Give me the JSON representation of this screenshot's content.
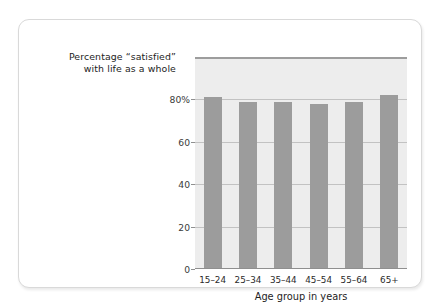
{
  "figure": {
    "background_color": "#ffffff",
    "border_color": "#d9d9d9",
    "plot_background_color": "#ededed",
    "bar_color": "#9c9c9c",
    "gridline_color": "#c2c2c2",
    "axis_color": "#8f8f8f"
  },
  "title_lines": [
    "Percentage “satisfied”",
    "with life as a whole"
  ],
  "chart_data": {
    "type": "bar",
    "title": "Percentage “satisfied” with life as a whole",
    "xlabel": "Age group in years",
    "ylabel": "",
    "categories": [
      "15–24",
      "25–34",
      "35–44",
      "45–54",
      "55–64",
      "65+"
    ],
    "values": [
      81,
      79,
      79,
      78,
      79,
      82
    ],
    "ylim": [
      0,
      100
    ],
    "yticks": [
      0,
      20,
      40,
      60,
      80
    ],
    "ytick_labels": [
      "0",
      "20",
      "40",
      "60",
      "80%"
    ],
    "grid": true,
    "legend": false,
    "legend_position": "none"
  }
}
